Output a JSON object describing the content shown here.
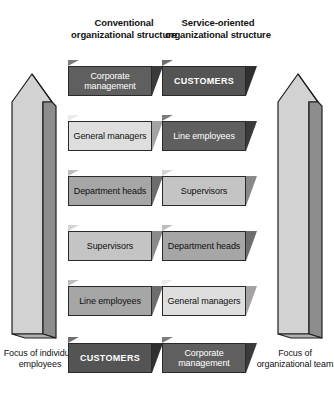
{
  "headers": {
    "left": "Conventional organizational structure",
    "right": "Service-oriented organizational structure"
  },
  "columns": [
    {
      "id": "conventional",
      "header": "Conventional organizational structure",
      "boxes": [
        {
          "label": "Corporate management",
          "shade": "dark",
          "caps": false
        },
        {
          "label": "General managers",
          "shade": "lightest",
          "caps": false
        },
        {
          "label": "Department heads",
          "shade": "med",
          "caps": false
        },
        {
          "label": "Supervisors",
          "shade": "light",
          "caps": false
        },
        {
          "label": "Line employees",
          "shade": "med",
          "caps": false
        },
        {
          "label": "CUSTOMERS",
          "shade": "darkest",
          "caps": true
        }
      ]
    },
    {
      "id": "service-oriented",
      "header": "Service-oriented organizational structure",
      "boxes": [
        {
          "label": "CUSTOMERS",
          "shade": "darkest",
          "caps": true
        },
        {
          "label": "Line employees",
          "shade": "dark",
          "caps": false
        },
        {
          "label": "Supervisors",
          "shade": "light",
          "caps": false
        },
        {
          "label": "Department heads",
          "shade": "med",
          "caps": false
        },
        {
          "label": "General managers",
          "shade": "lightest",
          "caps": false
        },
        {
          "label": "Corporate management",
          "shade": "dark",
          "caps": false
        }
      ]
    }
  ],
  "arrows": [
    {
      "id": "left",
      "direction": "up",
      "caption": "Focus of individual employees"
    },
    {
      "id": "right",
      "direction": "up",
      "caption": "Focus of organizational team"
    }
  ],
  "captions": {
    "left": "Focus of individual employees",
    "right": "Focus of organizational team"
  },
  "colors": {
    "background": "#ffffff",
    "text": "#111111",
    "outline": "#2a2a2a",
    "box_dark": "#5f5f5f",
    "box_darkest": "#545454",
    "box_med": "#a6a6a6",
    "box_light": "#c4c4c4",
    "box_lightest": "#dedede",
    "arrow_face": "#d2d2d2",
    "arrow_side": "#8d8d8d"
  }
}
